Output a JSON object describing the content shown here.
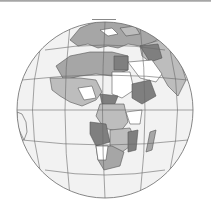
{
  "map": {
    "projection": "orthographic",
    "center_region": "Africa",
    "globe": {
      "cx": 105,
      "cy": 110,
      "r": 88
    },
    "colors": {
      "ocean": "#f2f2f2",
      "graticule": "#6a6a6a",
      "border": "#555555",
      "land_light": "#bdbdbd",
      "land_mid": "#a6a6a6",
      "land_dark": "#7f7f7f",
      "land_white": "#ffffff"
    },
    "regions": [
      "Europe",
      "North Africa",
      "West Africa",
      "Central Africa",
      "East Africa",
      "Southern Africa",
      "Arabian Peninsula",
      "Madagascar",
      "South America"
    ]
  }
}
